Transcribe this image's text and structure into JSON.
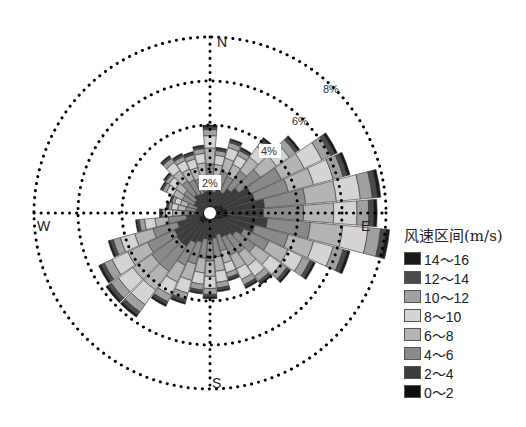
{
  "chart_data": {
    "type": "wind_rose",
    "title": "",
    "directions": {
      "N": "N",
      "E": "E",
      "S": "S",
      "W": "W"
    },
    "ring_labels": [
      "2%",
      "4%",
      "6%",
      "8%"
    ],
    "ring_values": [
      2,
      4,
      6,
      8
    ],
    "legend_title": "风速区间(m/s)",
    "legend": [
      {
        "label": "14～16",
        "color": "#1a1a1a"
      },
      {
        "label": "12～14",
        "color": "#4a4a4a"
      },
      {
        "label": "10～12",
        "color": "#a0a0a0"
      },
      {
        "label": "8～10",
        "color": "#d4d4d4"
      },
      {
        "label": "6～8",
        "color": "#b4b4b4"
      },
      {
        "label": "4～6",
        "color": "#8a8a8a"
      },
      {
        "label": "2～4",
        "color": "#3c3c3c"
      },
      {
        "label": "0～2",
        "color": "#0e0e0e"
      }
    ],
    "bins": [
      "0～2",
      "2～4",
      "4～6",
      "6～8",
      "8～10",
      "10～12",
      "12～14",
      "14～16"
    ],
    "sector_width_deg": 10,
    "sectors": [
      {
        "dir": 0,
        "total": 4.0
      },
      {
        "dir": 10,
        "total": 3.0
      },
      {
        "dir": 20,
        "total": 3.5
      },
      {
        "dir": 30,
        "total": 3.3
      },
      {
        "dir": 40,
        "total": 4.2
      },
      {
        "dir": 50,
        "total": 5.0
      },
      {
        "dir": 60,
        "total": 6.4
      },
      {
        "dir": 70,
        "total": 6.6
      },
      {
        "dir": 80,
        "total": 7.8
      },
      {
        "dir": 90,
        "total": 7.6
      },
      {
        "dir": 100,
        "total": 8.2
      },
      {
        "dir": 110,
        "total": 6.6
      },
      {
        "dir": 120,
        "total": 5.3
      },
      {
        "dir": 130,
        "total": 4.5
      },
      {
        "dir": 140,
        "total": 4.0
      },
      {
        "dir": 150,
        "total": 3.8
      },
      {
        "dir": 160,
        "total": 3.2
      },
      {
        "dir": 170,
        "total": 3.6
      },
      {
        "dir": 180,
        "total": 3.9
      },
      {
        "dir": 190,
        "total": 3.7
      },
      {
        "dir": 200,
        "total": 4.3
      },
      {
        "dir": 210,
        "total": 4.7
      },
      {
        "dir": 220,
        "total": 5.8
      },
      {
        "dir": 230,
        "total": 5.8
      },
      {
        "dir": 240,
        "total": 5.6
      },
      {
        "dir": 250,
        "total": 4.8
      },
      {
        "dir": 260,
        "total": 3.4
      },
      {
        "dir": 270,
        "total": 2.3
      },
      {
        "dir": 280,
        "total": 2.0
      },
      {
        "dir": 290,
        "total": 1.9
      },
      {
        "dir": 300,
        "total": 2.5
      },
      {
        "dir": 310,
        "total": 2.6
      },
      {
        "dir": 320,
        "total": 3.2
      },
      {
        "dir": 330,
        "total": 3.0
      },
      {
        "dir": 340,
        "total": 2.9
      },
      {
        "dir": 350,
        "total": 3.1
      }
    ],
    "bin_fractions": [
      0.1,
      0.22,
      0.24,
      0.18,
      0.14,
      0.07,
      0.03,
      0.02
    ],
    "rlim": [
      0,
      8
    ],
    "legend_position": "right"
  }
}
